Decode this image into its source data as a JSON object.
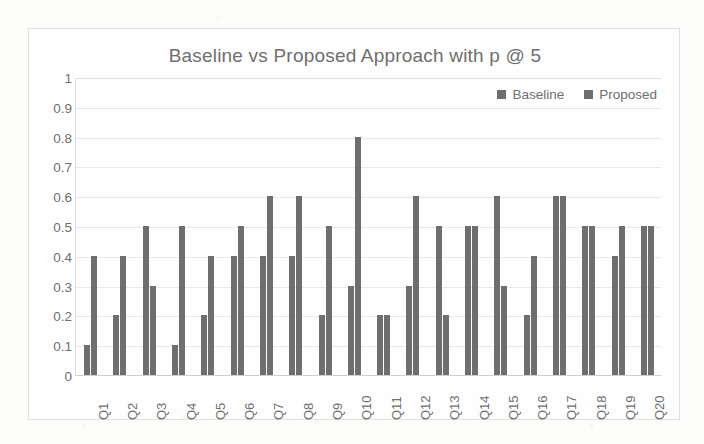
{
  "chart_data": {
    "type": "bar",
    "title": "Baseline vs Proposed Approach with p @ 5",
    "xlabel": "",
    "ylabel": "",
    "ylim": [
      0,
      1
    ],
    "ytick_step": 0.1,
    "grid": true,
    "legend_position": "top-right",
    "categories": [
      "Q1",
      "Q2",
      "Q3",
      "Q4",
      "Q5",
      "Q6",
      "Q7",
      "Q8",
      "Q9",
      "Q10",
      "Q11",
      "Q12",
      "Q13",
      "Q14",
      "Q15",
      "Q16",
      "Q17",
      "Q18",
      "Q19",
      "Q20"
    ],
    "ytick_labels": [
      "1",
      "0.9",
      "0.8",
      "0.7",
      "0.6",
      "0.5",
      "0.4",
      "0.3",
      "0.2",
      "0.1",
      "0"
    ],
    "ytick_values": [
      1,
      0.9,
      0.8,
      0.7,
      0.6,
      0.5,
      0.4,
      0.3,
      0.2,
      0.1,
      0
    ],
    "series": [
      {
        "name": "Baseline",
        "color": "#6e6e6e",
        "values": [
          0.1,
          0.2,
          0.5,
          0.1,
          0.2,
          0.4,
          0.4,
          0.4,
          0.2,
          0.3,
          0.2,
          0.3,
          0.5,
          0.5,
          0.6,
          0.2,
          0.6,
          0.5,
          0.4,
          0.5
        ]
      },
      {
        "name": "Proposed",
        "color": "#6e6e6e",
        "values": [
          0.4,
          0.4,
          0.3,
          0.5,
          0.4,
          0.5,
          0.6,
          0.6,
          0.5,
          0.8,
          0.2,
          0.6,
          0.2,
          0.5,
          0.3,
          0.4,
          0.6,
          0.5,
          0.5,
          0.5
        ]
      }
    ]
  },
  "legend": {
    "entries": [
      {
        "label": "Baseline",
        "marker": "square-marker-icon"
      },
      {
        "label": "Proposed",
        "marker": "square-marker-icon"
      }
    ]
  }
}
